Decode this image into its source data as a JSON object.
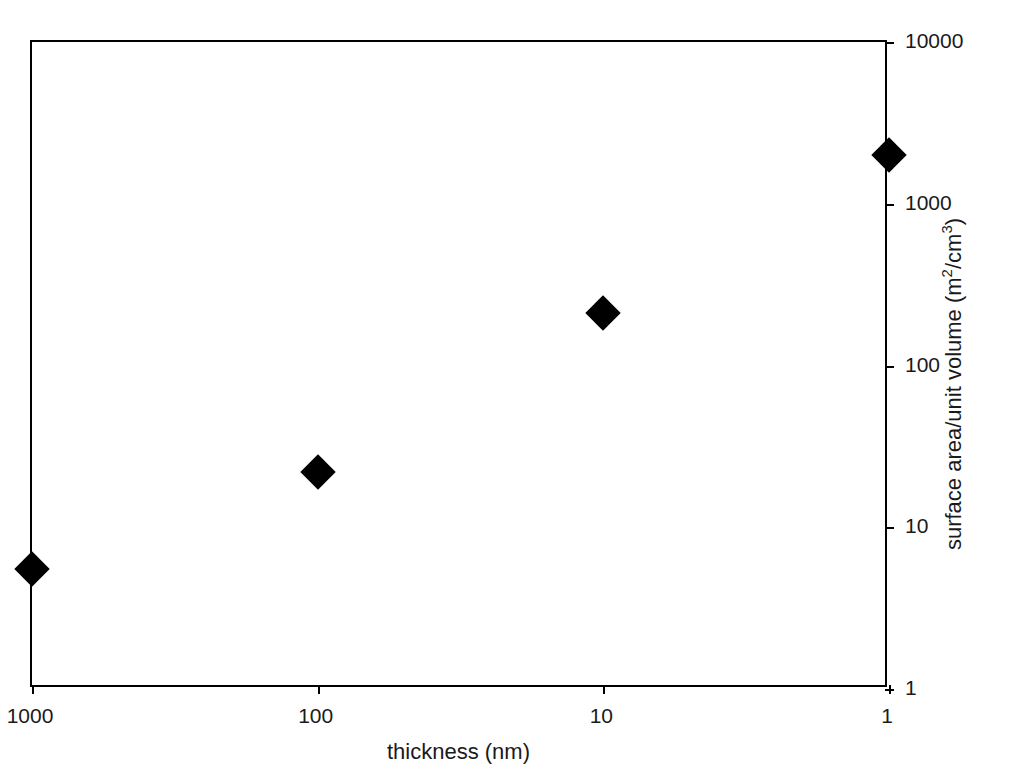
{
  "chart_data": {
    "type": "scatter",
    "title": "",
    "xlabel": "thickness (nm)",
    "ylabel_parts": {
      "text_before": "surface area/unit volume (m",
      "sup1": "2",
      "text_middle": "/cm",
      "sup2": "3",
      "text_after": ")"
    },
    "ylabel": "surface area/unit volume (m2/cm3)",
    "xscale": "log-reversed",
    "yscale": "log",
    "xlim": [
      1000,
      1
    ],
    "ylim": [
      1,
      10000
    ],
    "grid": false,
    "legend": "none",
    "marker_style": "filled-diamond",
    "marker_color": "#000000",
    "x_ticks": [
      "1000",
      "100",
      "10",
      "1"
    ],
    "y_ticks": [
      "1",
      "10",
      "100",
      "1000",
      "10000"
    ],
    "y_axis_position": "right",
    "x": [
      1000,
      100,
      10,
      1
    ],
    "values": [
      5.5,
      22,
      210,
      2000
    ],
    "points": [
      {
        "x": "1000",
        "y": "5.5"
      },
      {
        "x": "100",
        "y": "22"
      },
      {
        "x": "10",
        "y": "210"
      },
      {
        "x": "1",
        "y": "2000"
      }
    ]
  }
}
